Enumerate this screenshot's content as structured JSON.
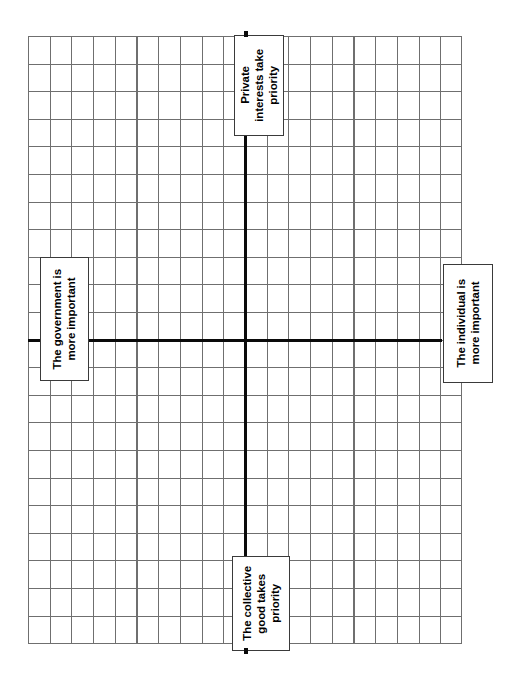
{
  "diagram": {
    "type": "two-axis-quadrant-compass",
    "orientation": "rotated-90-clockwise",
    "title": "",
    "background_color": "#ffffff",
    "grid": {
      "line_color": "#6f6f6f",
      "columns": 20,
      "rows": 22,
      "cell_width_px": 22,
      "cell_height_px": 28,
      "visible": true
    },
    "axes": {
      "color": "#0a0a0a",
      "thickness_px": 3,
      "vertical_axis_name": "collective-vs-private-priority-axis",
      "horizontal_axis_name": "government-vs-individual-axis",
      "origin_label": ""
    },
    "labels": {
      "top": "Private\ninterests take\npriority",
      "bottom": "The collective\ngood takes\npriority",
      "left": "The government is\nmore important",
      "right": "The individual is\nmore important"
    }
  },
  "chart_data": {
    "type": "scatter",
    "title": "",
    "subtitle": "",
    "xlabel": "",
    "ylabel": "",
    "x_axis_labels": {
      "negative_end": "The government is more important",
      "positive_end": "The individual is more important"
    },
    "y_axis_labels": {
      "positive_end": "Private interests take priority",
      "negative_end": "The collective good takes priority"
    },
    "series": [
      {
        "name": "plotted-points",
        "x": [],
        "y": []
      }
    ],
    "xlim": [
      -10,
      10
    ],
    "ylim": [
      -11,
      11
    ],
    "grid": true,
    "legend": "none",
    "annotations": []
  }
}
